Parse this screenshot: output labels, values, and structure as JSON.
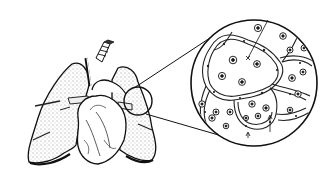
{
  "figure": {
    "colors": {
      "ink": "#111111",
      "paper": "#ffffff",
      "stipple": "#9a9a9a"
    },
    "magnifier_small": {
      "cx": 138,
      "cy": 101,
      "r": 14
    },
    "magnifier_large": {
      "cx": 254,
      "cy": 83,
      "r": 63
    }
  }
}
